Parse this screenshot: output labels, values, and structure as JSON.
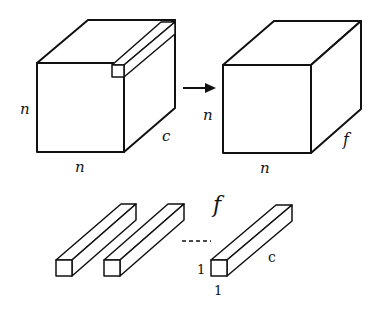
{
  "diagram": {
    "input_volume": {
      "labels": {
        "height": "n",
        "width": "n",
        "depth": "c"
      }
    },
    "arrow": {
      "direction": "right"
    },
    "output_volume": {
      "labels": {
        "height": "n",
        "width": "n",
        "depth": "f"
      }
    },
    "filters": {
      "count_label": "f",
      "ellipsis": "----",
      "filter_labels": {
        "height": "1",
        "width": "1",
        "depth": "c"
      }
    },
    "colors": {
      "stroke": "#111111",
      "fill": "#ffffff"
    }
  }
}
